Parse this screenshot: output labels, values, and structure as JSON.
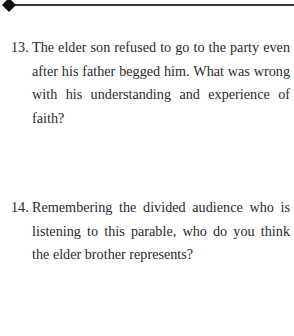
{
  "header": {
    "ornament_icon": "diamond-icon"
  },
  "questions": [
    {
      "number": "13.",
      "text": "The elder son refused to go to the party even after his father begged him. What was wrong with his understanding and experience of faith?"
    },
    {
      "number": "14.",
      "text": "Remembering the divided audience who is listening to this parable, who do you think the elder brother represents?"
    }
  ]
}
